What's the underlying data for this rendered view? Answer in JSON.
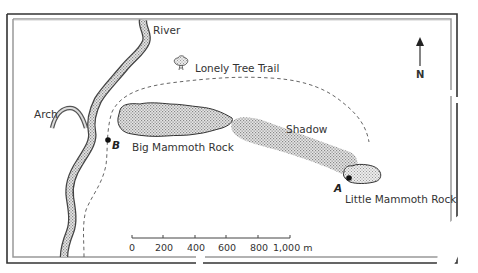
{
  "map": {
    "labels": {
      "river": "River",
      "lonely_tree_trail": "Lonely Tree Trail",
      "arch": "Arch",
      "shadow": "Shadow",
      "big_mammoth_rock": "Big Mammoth Rock",
      "little_mammoth_rock": "Little Mammoth Rock",
      "point_a": "A",
      "point_b": "B",
      "north": "N"
    },
    "scale_bar": {
      "ticks": [
        "0",
        "200",
        "400",
        "600",
        "800",
        "1,000 m"
      ],
      "unit": "m"
    },
    "colors": {
      "frame_outer": "#333333",
      "frame_inner": "#999999",
      "stipple_fill": "#bdbdbd",
      "outline": "#444444",
      "trail": "#666666"
    }
  }
}
